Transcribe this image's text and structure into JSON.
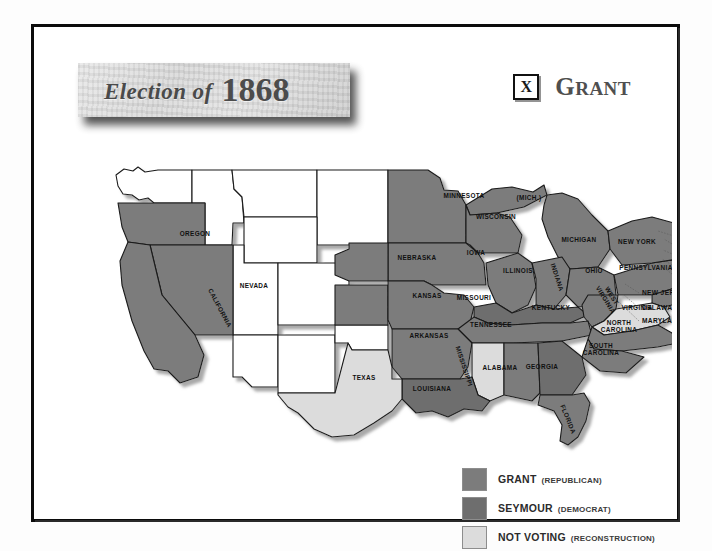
{
  "header": {
    "title_prefix": "Election of",
    "title_year": "1868",
    "winner_mark": "X",
    "winner_name_first": "G",
    "winner_name_rest": "RANT"
  },
  "legend": {
    "items": [
      {
        "label": "GRANT",
        "sub": "(REPUBLICAN)",
        "color": "#7c7c7c",
        "key": "grant"
      },
      {
        "label": "SEYMOUR",
        "sub": "(DEMOCRAT)",
        "color": "#6e6e6e",
        "key": "seymour"
      },
      {
        "label": "NOT VOTING",
        "sub": "(RECONSTRUCTION)",
        "color": "#dcdcdc",
        "key": "notvote"
      }
    ]
  },
  "map": {
    "inside_labels": [
      {
        "name": "OREGON",
        "x": 103,
        "y": 91,
        "rotate": 0,
        "status": "grant"
      },
      {
        "name": "NEVADA",
        "x": 162,
        "y": 143,
        "rotate": 0,
        "status": "grant"
      },
      {
        "name": "CALIFORNIA",
        "x": 126,
        "y": 164,
        "rotate": 62,
        "status": "grant"
      },
      {
        "name": "MINNESOTA",
        "x": 372,
        "y": 53,
        "rotate": 0,
        "status": "grant"
      },
      {
        "name": "(MICH.)",
        "x": 437,
        "y": 55,
        "rotate": 0,
        "status": "grant"
      },
      {
        "name": "WISCONSIN",
        "x": 404,
        "y": 74,
        "rotate": 0,
        "status": "grant"
      },
      {
        "name": "MICHIGAN",
        "x": 487,
        "y": 97,
        "rotate": 0,
        "status": "grant"
      },
      {
        "name": "IOWA",
        "x": 384,
        "y": 110,
        "rotate": 0,
        "status": "grant"
      },
      {
        "name": "NEBRASKA",
        "x": 325,
        "y": 115,
        "rotate": 0,
        "status": "grant"
      },
      {
        "name": "ILLINOIS",
        "x": 426,
        "y": 128,
        "rotate": 0,
        "status": "grant"
      },
      {
        "name": "INDIANA",
        "x": 463,
        "y": 133,
        "rotate": 72,
        "status": "grant"
      },
      {
        "name": "OHIO",
        "x": 502,
        "y": 128,
        "rotate": 0,
        "status": "grant"
      },
      {
        "name": "PENNSYLVANIA",
        "x": 554,
        "y": 125,
        "rotate": 0,
        "status": "grant"
      },
      {
        "name": "NEW YORK",
        "x": 545,
        "y": 99,
        "rotate": 0,
        "status": "grant"
      },
      {
        "name": "MAINE",
        "x": 604,
        "y": 70,
        "rotate": 0,
        "status": "grant"
      },
      {
        "name": "KANSAS",
        "x": 335,
        "y": 153,
        "rotate": 0,
        "status": "grant"
      },
      {
        "name": "MISSOURI",
        "x": 382,
        "y": 155,
        "rotate": 0,
        "status": "grant"
      },
      {
        "name": "KENTUCKY",
        "x": 459,
        "y": 165,
        "rotate": 0,
        "status": "seymour"
      },
      {
        "name": "WEST VIRGINIA",
        "x": 518,
        "y": 152,
        "rotate": 58,
        "status": "grant"
      },
      {
        "name": "VIRGINIA",
        "x": 545,
        "y": 165,
        "rotate": 0,
        "status": "notvote"
      },
      {
        "name": "ARKANSAS",
        "x": 337,
        "y": 193,
        "rotate": 0,
        "status": "grant"
      },
      {
        "name": "TENNESSEE",
        "x": 399,
        "y": 182,
        "rotate": 0,
        "status": "grant"
      },
      {
        "name": "NORTH CAROLINA",
        "x": 527,
        "y": 180,
        "rotate": 0,
        "status": "grant"
      },
      {
        "name": "SOUTH CAROLINA",
        "x": 509,
        "y": 203,
        "rotate": 0,
        "status": "grant"
      },
      {
        "name": "MISSISSIPPI",
        "x": 370,
        "y": 222,
        "rotate": 72,
        "status": "notvote"
      },
      {
        "name": "ALABAMA",
        "x": 408,
        "y": 225,
        "rotate": 0,
        "status": "grant"
      },
      {
        "name": "GEORGIA",
        "x": 450,
        "y": 224,
        "rotate": 0,
        "status": "seymour"
      },
      {
        "name": "LOUISIANA",
        "x": 340,
        "y": 246,
        "rotate": 0,
        "status": "seymour"
      },
      {
        "name": "TEXAS",
        "x": 272,
        "y": 235,
        "rotate": 0,
        "status": "notvote"
      },
      {
        "name": "FLORIDA",
        "x": 474,
        "y": 275,
        "rotate": 68,
        "status": "grant"
      }
    ],
    "outside_labels": [
      {
        "name": "VERMONT",
        "x": 588,
        "y": 94,
        "lx": 585,
        "ly": 92,
        "tx": 566,
        "ty": 86
      },
      {
        "name": "NEW HAMPSHIRE",
        "x": 588,
        "y": 104,
        "lx": 585,
        "ly": 102,
        "tx": 572,
        "ty": 94
      },
      {
        "name": "MASSACHUSETTS",
        "x": 588,
        "y": 113,
        "lx": 585,
        "ly": 111,
        "tx": 571,
        "ty": 105
      },
      {
        "name": "RHODE ISLAND",
        "x": 588,
        "y": 125,
        "lx": 585,
        "ly": 123,
        "tx": 570,
        "ty": 114
      },
      {
        "name": "CONNECTICUT",
        "x": 588,
        "y": 135,
        "lx": 585,
        "ly": 133,
        "tx": 566,
        "ty": 118
      },
      {
        "name": "NEW JERSEY",
        "x": 550,
        "y": 150,
        "lx": 547,
        "ly": 148,
        "tx": 533,
        "ty": 139
      },
      {
        "name": "DELAWARE",
        "x": 550,
        "y": 165,
        "lx": 547,
        "ly": 163,
        "tx": 531,
        "ty": 149
      },
      {
        "name": "MARYLAND",
        "x": 550,
        "y": 178,
        "lx": 547,
        "ly": 176,
        "tx": 527,
        "ty": 157
      }
    ]
  }
}
